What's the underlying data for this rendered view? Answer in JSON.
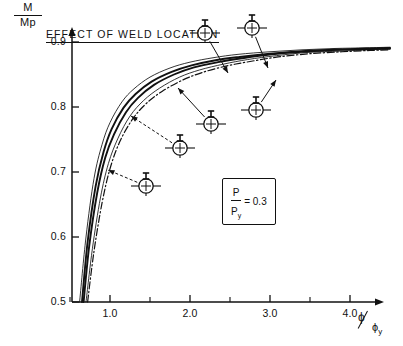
{
  "chart_data": {
    "type": "line",
    "title": "EFFECT OF WELD LOCATION",
    "xlabel": "ϕ/ϕy",
    "ylabel": "M/Mp",
    "xlim": [
      0.0,
      4.55
    ],
    "ylim": [
      0.5,
      0.93
    ],
    "grid": false,
    "legend": "none",
    "x_ticks_major": [
      1.0,
      2.0,
      3.0,
      4.0
    ],
    "x_tick_labels": [
      "1.0",
      "2.0",
      "3.0",
      "4.0"
    ],
    "x_ticks_minor": [
      0.5,
      1.5,
      2.5,
      3.5
    ],
    "y_ticks": [
      0.5,
      0.6,
      0.7,
      0.8,
      0.9
    ],
    "y_tick_labels": [
      "0.5",
      "0.6",
      "0.7",
      "0.8",
      "0.9"
    ],
    "annotation_box": "P/Py = 0.3",
    "series": [
      {
        "name": "curve-1-uppermost-thin",
        "style": "thin-solid",
        "x": [
          0.62,
          0.7,
          0.8,
          0.9,
          1.0,
          1.15,
          1.3,
          1.5,
          1.75,
          2.0,
          2.3,
          2.6,
          3.0,
          3.4,
          3.8,
          4.2,
          4.5
        ],
        "y": [
          0.5,
          0.6,
          0.69,
          0.742,
          0.776,
          0.808,
          0.828,
          0.846,
          0.86,
          0.869,
          0.876,
          0.881,
          0.885,
          0.888,
          0.89,
          0.891,
          0.892
        ]
      },
      {
        "name": "curve-2-thick",
        "style": "thick-solid",
        "x": [
          0.65,
          0.72,
          0.82,
          0.92,
          1.02,
          1.17,
          1.32,
          1.52,
          1.77,
          2.02,
          2.32,
          2.62,
          3.0,
          3.4,
          3.8,
          4.2,
          4.5
        ],
        "y": [
          0.5,
          0.592,
          0.678,
          0.731,
          0.766,
          0.799,
          0.82,
          0.839,
          0.854,
          0.864,
          0.872,
          0.877,
          0.882,
          0.886,
          0.888,
          0.89,
          0.891
        ]
      },
      {
        "name": "curve-3-thick",
        "style": "thick-solid",
        "x": [
          0.67,
          0.74,
          0.84,
          0.94,
          1.05,
          1.2,
          1.35,
          1.55,
          1.8,
          2.05,
          2.35,
          2.65,
          3.02,
          3.42,
          3.82,
          4.22,
          4.5
        ],
        "y": [
          0.5,
          0.586,
          0.668,
          0.722,
          0.758,
          0.792,
          0.814,
          0.834,
          0.85,
          0.861,
          0.869,
          0.875,
          0.881,
          0.885,
          0.888,
          0.889,
          0.89
        ]
      },
      {
        "name": "curve-4-dashdot",
        "style": "dash-dot",
        "x": [
          0.72,
          0.8,
          0.9,
          1.0,
          1.12,
          1.28,
          1.45,
          1.65,
          1.9,
          2.15,
          2.45,
          2.75,
          3.1,
          3.5,
          3.9,
          4.25,
          4.5
        ],
        "y": [
          0.5,
          0.578,
          0.652,
          0.705,
          0.746,
          0.781,
          0.805,
          0.824,
          0.841,
          0.853,
          0.863,
          0.87,
          0.877,
          0.882,
          0.885,
          0.887,
          0.888
        ]
      },
      {
        "name": "curve-5-lower-thin",
        "style": "thin-solid",
        "x": [
          0.7,
          0.78,
          0.88,
          0.98,
          1.1,
          1.25,
          1.42,
          1.62,
          1.87,
          2.12,
          2.42,
          2.72,
          3.08,
          3.48,
          3.88,
          4.24,
          4.5
        ],
        "y": [
          0.5,
          0.582,
          0.66,
          0.713,
          0.752,
          0.786,
          0.81,
          0.829,
          0.846,
          0.857,
          0.866,
          0.873,
          0.879,
          0.884,
          0.886,
          0.888,
          0.889
        ]
      }
    ],
    "section_markers": [
      {
        "name": "weld-section-marker-1",
        "cx": 205,
        "cy": 33,
        "leader_to_x": 228,
        "leader_to_y": 73,
        "dashed": false
      },
      {
        "name": "weld-section-marker-2",
        "cx": 252,
        "cy": 28,
        "leader_to_x": 268,
        "leader_to_y": 68,
        "dashed": false
      },
      {
        "name": "weld-section-marker-3",
        "cx": 256,
        "cy": 110,
        "leader_to_x": 276,
        "leader_to_y": 80,
        "dashed": false
      },
      {
        "name": "weld-section-marker-4",
        "cx": 211,
        "cy": 124,
        "leader_to_x": 178,
        "leader_to_y": 88,
        "dashed": false
      },
      {
        "name": "weld-section-marker-5",
        "cx": 180,
        "cy": 148,
        "leader_to_x": 131,
        "leader_to_y": 116,
        "dashed": true
      },
      {
        "name": "weld-section-marker-6",
        "cx": 146,
        "cy": 186,
        "leader_to_x": 108,
        "leader_to_y": 170,
        "dashed": true
      }
    ]
  },
  "axes": {
    "y_label_num": "M",
    "y_label_den": "Mp",
    "x_label_num": "ϕ",
    "x_label_den": "ϕ",
    "x_label_den_sub": "y"
  },
  "annotation": {
    "p_over_py_num": "P",
    "p_over_py_den": "P",
    "p_over_py_den_sub": "y",
    "p_over_py_eq": "= 0.3"
  },
  "colors": {
    "ink": "#111111",
    "background": "#ffffff"
  }
}
